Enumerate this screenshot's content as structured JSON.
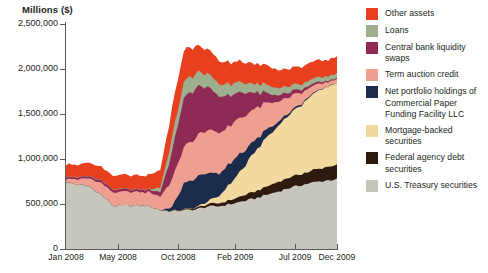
{
  "chart_data": {
    "type": "area",
    "title": "",
    "ylabel": "Millions ($)",
    "xlabel": "",
    "ylim": [
      0,
      2500000
    ],
    "yticks": [
      "0",
      "500,000",
      "1,000,000",
      "1,500,000",
      "2,000,000",
      "2,500,000"
    ],
    "ytick_values": [
      0,
      500000,
      1000000,
      1500000,
      2000000,
      2500000
    ],
    "xticks": [
      "Jan 2008",
      "May 2008",
      "Oct 2008",
      "Feb 2009",
      "Jul 2009",
      "Dec 2009"
    ],
    "xtick_positions": [
      0,
      0.192,
      0.414,
      0.624,
      0.845,
      1.0
    ],
    "grid": false,
    "legend_position": "right",
    "stacking": "bottom-to-top: U.S. Treasury securities, Federal agency debt securities, Mortgage-backed securities, Net portfolio holdings of Commercial Paper Funding Facility LLC, Term auction credit, Central bank liquidity swaps, Loans, Other assets",
    "x": [
      "Jan 2008",
      "Feb 2008",
      "Mar 2008",
      "Apr 2008",
      "May 2008",
      "Jun 2008",
      "Jul 2008",
      "Aug 2008",
      "Sep 2008",
      "Oct 2008",
      "Nov 2008",
      "Dec 2008",
      "Jan 2009",
      "Feb 2009",
      "Mar 2009",
      "Apr 2009",
      "May 2009",
      "Jun 2009",
      "Jul 2009",
      "Aug 2009",
      "Sep 2009",
      "Oct 2009",
      "Nov 2009",
      "Dec 2009"
    ],
    "series": [
      {
        "name": "U.S. Treasury securities",
        "color": "#c6c6bd",
        "values": [
          740000,
          715000,
          690000,
          600000,
          480000,
          480000,
          480000,
          480000,
          430000,
          420000,
          430000,
          440000,
          470000,
          475000,
          500000,
          530000,
          560000,
          600000,
          640000,
          680000,
          710000,
          740000,
          760000,
          776000
        ]
      },
      {
        "name": "Federal agency debt securities",
        "color": "#2e1a0e",
        "values": [
          0,
          0,
          0,
          0,
          0,
          0,
          0,
          0,
          0,
          5000,
          10000,
          15000,
          25000,
          35000,
          45000,
          60000,
          75000,
          90000,
          105000,
          115000,
          125000,
          135000,
          145000,
          160000
        ]
      },
      {
        "name": "Mortgage-backed securities",
        "color": "#f3d9a0",
        "values": [
          0,
          0,
          0,
          0,
          0,
          0,
          0,
          0,
          0,
          0,
          0,
          5000,
          30000,
          80000,
          190000,
          300000,
          430000,
          540000,
          620000,
          700000,
          775000,
          845000,
          890000,
          910000
        ]
      },
      {
        "name": "Net portfolio holdings of Commercial Paper Funding Facility LLC",
        "color": "#1b2b4b",
        "values": [
          0,
          0,
          0,
          0,
          0,
          0,
          0,
          0,
          0,
          40000,
          280000,
          330000,
          320000,
          250000,
          230000,
          180000,
          130000,
          90000,
          45000,
          25000,
          15000,
          10000,
          5000,
          2000
        ]
      },
      {
        "name": "Term auction credit",
        "color": "#ef9f8f",
        "values": [
          40000,
          60000,
          90000,
          130000,
          150000,
          150000,
          150000,
          150000,
          150000,
          300000,
          410000,
          450000,
          480000,
          450000,
          420000,
          400000,
          350000,
          290000,
          230000,
          170000,
          120000,
          80000,
          50000,
          38000
        ]
      },
      {
        "name": "Central bank liquidity swaps",
        "color": "#8f2a55",
        "values": [
          20000,
          22000,
          25000,
          28000,
          28000,
          28000,
          28000,
          28000,
          50000,
          300000,
          550000,
          545000,
          480000,
          400000,
          330000,
          270000,
          180000,
          110000,
          70000,
          50000,
          35000,
          25000,
          15000,
          10000
        ]
      },
      {
        "name": "Loans",
        "color": "#9daf8e",
        "values": [
          5000,
          5000,
          5000,
          5000,
          5000,
          5000,
          5000,
          5000,
          50000,
          160000,
          180000,
          170000,
          150000,
          135000,
          125000,
          110000,
          100000,
          90000,
          80000,
          70000,
          60000,
          55000,
          50000,
          48000
        ]
      },
      {
        "name": "Other assets",
        "color": "#e8401e",
        "values": [
          135000,
          140000,
          145000,
          150000,
          150000,
          150000,
          150000,
          150000,
          200000,
          330000,
          350000,
          300000,
          270000,
          250000,
          240000,
          230000,
          220000,
          215000,
          205000,
          200000,
          195000,
          190000,
          185000,
          180000
        ]
      }
    ],
    "totals": [
      940000,
      942000,
      955000,
      913000,
      813000,
      813000,
      813000,
      813000,
      880000,
      1555000,
      2210000,
      2255000,
      2225000,
      2075000,
      2080000,
      2080000,
      2045000,
      2025000,
      1995000,
      2010000,
      2035000,
      2080000,
      2100000,
      2124000
    ]
  },
  "legend": {
    "items": [
      {
        "label": "Other assets",
        "color": "#e8401e",
        "name": "legend-other-assets"
      },
      {
        "label": "Loans",
        "color": "#9daf8e",
        "name": "legend-loans"
      },
      {
        "label": "Central bank liquidity swaps",
        "color": "#8f2a55",
        "name": "legend-central-bank-liquidity-swaps"
      },
      {
        "label": "Term auction credit",
        "color": "#ef9f8f",
        "name": "legend-term-auction-credit"
      },
      {
        "label": "Net portfolio holdings of Commercial Paper Funding Facility LLC",
        "color": "#1b2b4b",
        "name": "legend-cpff"
      },
      {
        "label": "Mortgage-backed securities",
        "color": "#f3d9a0",
        "name": "legend-mortgage-backed-securities"
      },
      {
        "label": "Federal agency debt securities",
        "color": "#2e1a0e",
        "name": "legend-federal-agency-debt-securities"
      },
      {
        "label": "U.S. Treasury securities",
        "color": "#c6c6bd",
        "name": "legend-us-treasury-securities"
      }
    ]
  },
  "axes": {
    "y_title": "Millions ($)",
    "y_labels": [
      "2,500,000",
      "2,000,000",
      "1,500,000",
      "1,000,000",
      "500,000",
      "0"
    ],
    "x_labels": [
      "Jan 2008",
      "May 2008",
      "Oct 2008",
      "Feb 2009",
      "Jul 2009",
      "Dec 2009"
    ]
  }
}
